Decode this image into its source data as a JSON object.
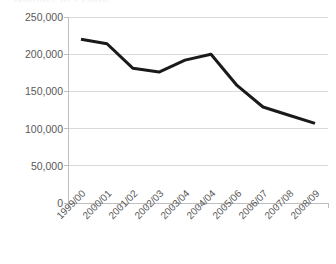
{
  "chart_data": {
    "type": "line",
    "title": "",
    "xlabel": "",
    "ylabel": "",
    "categories": [
      "1999/00",
      "2000/01",
      "2001/02",
      "2002/03",
      "2003/04",
      "2004/04",
      "2005/06",
      "2006/07",
      "2007/08",
      "2008/09"
    ],
    "values": [
      220000,
      214000,
      181000,
      176000,
      192000,
      200000,
      158000,
      129000,
      118000,
      107000
    ],
    "series": [
      {
        "name": "",
        "values": [
          220000,
          214000,
          181000,
          176000,
          192000,
          200000,
          158000,
          129000,
          118000,
          107000
        ]
      }
    ],
    "ylim": [
      0,
      250000
    ],
    "yticks": [
      0,
      50000,
      100000,
      150000,
      200000,
      250000
    ],
    "ytick_labels": [
      "0",
      "50,000",
      "100,000",
      "150,000",
      "200,000",
      "250,000"
    ],
    "grid": true,
    "grid_axis": "y",
    "legend": false,
    "legend_position": "none",
    "line_color": "#1a1a1a",
    "grid_color": "#d9d9d9",
    "axis_color": "#bfbfbf",
    "background_color": "#ffffff",
    "text_color": "#595959",
    "line_width": 3,
    "xtick_label_rotation": -45
  },
  "clipped_title": "Number of People"
}
